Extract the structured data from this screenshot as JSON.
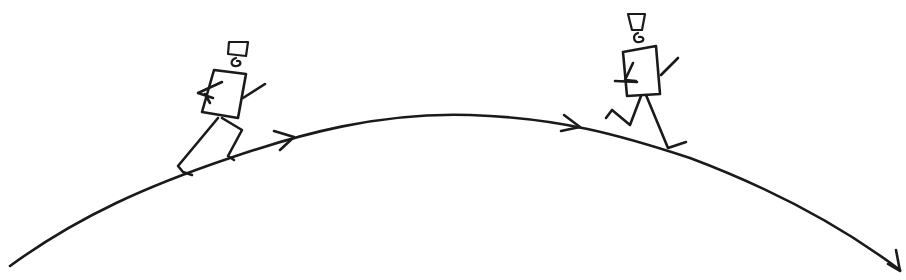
{
  "diagram": {
    "ink_color": "#1a1a1a",
    "background_color": "#ffffff",
    "elements": [
      {
        "id": "arc-path",
        "kind": "curve",
        "shape": "parabolic arc",
        "direction": "left-to-right"
      },
      {
        "id": "direction-arrow-1",
        "kind": "arrowhead",
        "on": "arc-path",
        "segment": "ascending"
      },
      {
        "id": "direction-arrow-2",
        "kind": "arrowhead",
        "on": "arc-path",
        "segment": "past-peak"
      },
      {
        "id": "direction-arrow-3",
        "kind": "arrowhead",
        "on": "arc-path",
        "segment": "end"
      },
      {
        "id": "runner-uphill",
        "kind": "stick-figure",
        "pose": "running uphill",
        "location": "left slope"
      },
      {
        "id": "runner-downhill",
        "kind": "stick-figure",
        "pose": "running downhill",
        "location": "right slope"
      }
    ],
    "labels": []
  }
}
